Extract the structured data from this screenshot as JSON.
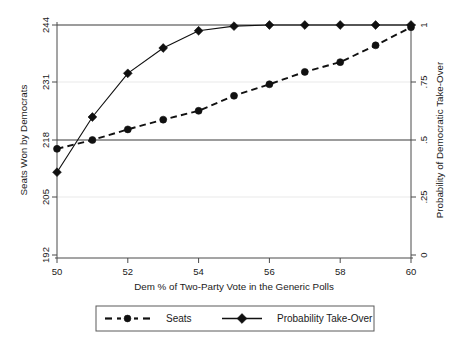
{
  "chart_data": {
    "type": "line",
    "title": "",
    "subtitle": "",
    "xlabel": "Dem % of Two-Party Vote in the Generic Polls",
    "ylabel": "Seats Won by Democrats",
    "y2label": "Probability of Democratic Take-Over",
    "x": [
      50,
      51,
      52,
      53,
      54,
      55,
      56,
      57,
      58,
      59,
      60
    ],
    "xlim": [
      50,
      60
    ],
    "xticks": [
      50,
      52,
      54,
      56,
      58,
      60
    ],
    "xticklabels": [
      "50",
      "52",
      "54",
      "56",
      "58",
      "60"
    ],
    "ylim": [
      192,
      244
    ],
    "yticks": [
      192,
      205,
      218,
      231,
      244
    ],
    "yticklabels": [
      "192",
      "205",
      "218",
      "231",
      "244"
    ],
    "y2lim": [
      0,
      1
    ],
    "y2ticks": [
      0,
      0.25,
      0.5,
      0.75,
      1
    ],
    "y2ticklabels": [
      "0",
      ".25",
      ".5",
      ".75",
      "1"
    ],
    "grid": true,
    "legend_position": "below",
    "reference_lines": [
      {
        "axis": "y",
        "value": 244,
        "label": "244 seats / probability 1"
      },
      {
        "axis": "y",
        "value": 218,
        "label": "218 seats / probability .5"
      }
    ],
    "series": [
      {
        "name": "Seats",
        "axis": "left",
        "style": "dashed",
        "marker": "circle",
        "values": [
          216.0,
          218.0,
          220.4,
          222.6,
          224.6,
          228.0,
          230.6,
          233.4,
          235.6,
          239.4,
          243.5
        ]
      },
      {
        "name": "Probability Take-Over",
        "axis": "right",
        "style": "solid",
        "marker": "diamond",
        "values": [
          0.36,
          0.6,
          0.79,
          0.9,
          0.975,
          0.995,
          1.0,
          1.0,
          1.0,
          1.0,
          1.0
        ]
      }
    ]
  },
  "legend": {
    "entries": [
      {
        "label": "Seats",
        "marker": "circle",
        "style": "dashed"
      },
      {
        "label": "Probability Take-Over",
        "marker": "diamond",
        "style": "solid"
      }
    ]
  },
  "colors": {
    "ink": "#111111",
    "axis": "#4a4a4a",
    "grid": "#e9e9e9",
    "background": "#ffffff"
  }
}
